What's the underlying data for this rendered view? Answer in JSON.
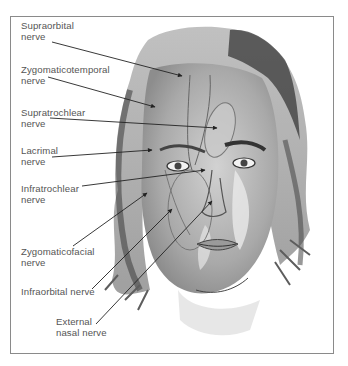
{
  "diagram": {
    "type": "anatomical-illustration",
    "colors": {
      "frame": "#8a8a8a",
      "text": "#555555",
      "arrow": "#222222"
    },
    "labels": [
      {
        "id": "supraorbital",
        "line1": "Supraorbital",
        "line2": "nerve",
        "x": 21,
        "y": 20,
        "from": [
          52,
          42
        ],
        "to": [
          182,
          76
        ]
      },
      {
        "id": "zygomaticotemporal",
        "line1": "Zygomaticotemporal",
        "line2": "nerve",
        "x": 21,
        "y": 64,
        "from": [
          48,
          77
        ],
        "to": [
          155,
          107
        ]
      },
      {
        "id": "supratrochlear",
        "line1": "Supratrochlear",
        "line2": "nerve",
        "x": 21,
        "y": 107,
        "from": [
          50,
          118
        ],
        "to": [
          217,
          128
        ]
      },
      {
        "id": "lacrimal",
        "line1": "Lacrimal",
        "line2": "nerve",
        "x": 21,
        "y": 145,
        "from": [
          52,
          157
        ],
        "to": [
          152,
          150
        ]
      },
      {
        "id": "infratrochlear",
        "line1": "Infratrochlear",
        "line2": "nerve",
        "x": 21,
        "y": 183,
        "from": [
          82,
          186
        ],
        "to": [
          205,
          170
        ]
      },
      {
        "id": "zygomaticofacial",
        "line1": "Zygomaticofacial",
        "line2": "nerve",
        "x": 21,
        "y": 246,
        "from": [
          73,
          246
        ],
        "to": [
          147,
          193
        ]
      },
      {
        "id": "infraorbital",
        "line1": "Infraorbital nerve",
        "line2": "",
        "x": 21,
        "y": 286,
        "from": [
          92,
          289
        ],
        "to": [
          172,
          209
        ]
      },
      {
        "id": "external-nasal",
        "line1": "External",
        "line2": "nasal nerve",
        "x": 56,
        "y": 316,
        "from": [
          96,
          324
        ],
        "to": [
          212,
          201
        ]
      }
    ]
  }
}
